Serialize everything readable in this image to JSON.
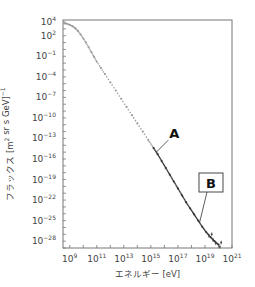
{
  "chart_data": {
    "type": "scatter",
    "title": "",
    "xlabel": "エネルギー [eV]",
    "ylabel": "フラックス [m² sr s GeV]⁻¹",
    "ylabel_parts": {
      "main": "フラックス [m",
      "sup1": "2",
      "mid": " sr s GeV]",
      "sup2": "−1"
    },
    "x_scale": "log",
    "y_scale": "log",
    "xlim_exp": [
      8.5,
      21
    ],
    "ylim_exp": [
      -29,
      4.3
    ],
    "x_ticks": [
      {
        "base": "10",
        "exp": "9",
        "value_exp": 9
      },
      {
        "base": "10",
        "exp": "11",
        "value_exp": 11
      },
      {
        "base": "10",
        "exp": "13",
        "value_exp": 13
      },
      {
        "base": "10",
        "exp": "15",
        "value_exp": 15
      },
      {
        "base": "10",
        "exp": "17",
        "value_exp": 17
      },
      {
        "base": "10",
        "exp": "19",
        "value_exp": 19
      },
      {
        "base": "10",
        "exp": "21",
        "value_exp": 21
      }
    ],
    "y_ticks": [
      {
        "base": "10",
        "exp": "4",
        "value_exp": 4
      },
      {
        "base": "10",
        "exp": "2",
        "value_exp": 2
      },
      {
        "base": "10",
        "exp": "−1",
        "value_exp": -1
      },
      {
        "base": "10",
        "exp": "−4",
        "value_exp": -4
      },
      {
        "base": "10",
        "exp": "−7",
        "value_exp": -7
      },
      {
        "base": "10",
        "exp": "−10",
        "value_exp": -10
      },
      {
        "base": "10",
        "exp": "−13",
        "value_exp": -13
      },
      {
        "base": "10",
        "exp": "−16",
        "value_exp": -16
      },
      {
        "base": "10",
        "exp": "−19",
        "value_exp": -19
      },
      {
        "base": "10",
        "exp": "−22",
        "value_exp": -22
      },
      {
        "base": "10",
        "exp": "−25",
        "value_exp": -25
      },
      {
        "base": "10",
        "exp": "−28",
        "value_exp": -28
      }
    ],
    "series": [
      {
        "name": "cosmic-ray flux",
        "points_log10": [
          [
            8.6,
            3.8
          ],
          [
            8.8,
            3.75
          ],
          [
            9.0,
            3.6
          ],
          [
            9.2,
            3.4
          ],
          [
            9.4,
            3.1
          ],
          [
            9.6,
            2.7
          ],
          [
            9.8,
            2.2
          ],
          [
            10.0,
            1.6
          ],
          [
            10.2,
            1.0
          ],
          [
            10.4,
            0.3
          ],
          [
            10.6,
            -0.4
          ],
          [
            10.8,
            -1.1
          ],
          [
            11.0,
            -1.8
          ],
          [
            11.3,
            -2.7
          ],
          [
            11.6,
            -3.6
          ],
          [
            12.0,
            -4.8
          ],
          [
            12.4,
            -6.0
          ],
          [
            12.8,
            -7.2
          ],
          [
            13.2,
            -8.4
          ],
          [
            13.6,
            -9.6
          ],
          [
            14.0,
            -10.8
          ],
          [
            14.4,
            -12.0
          ],
          [
            14.8,
            -13.2
          ],
          [
            15.2,
            -14.4
          ],
          [
            15.5,
            -15.3
          ],
          [
            15.8,
            -16.3
          ],
          [
            16.1,
            -17.3
          ],
          [
            16.4,
            -18.3
          ],
          [
            16.7,
            -19.3
          ],
          [
            17.0,
            -20.3
          ],
          [
            17.3,
            -21.3
          ],
          [
            17.6,
            -22.3
          ],
          [
            17.9,
            -23.2
          ],
          [
            18.2,
            -24.1
          ],
          [
            18.5,
            -25.0
          ],
          [
            18.8,
            -25.9
          ],
          [
            19.1,
            -26.7
          ],
          [
            19.4,
            -27.4
          ],
          [
            19.7,
            -28.0
          ],
          [
            20.0,
            -28.5
          ]
        ]
      }
    ],
    "annotations": [
      {
        "label": "A",
        "boxed": false,
        "points_to_log10": [
          15.4,
          -15.0
        ]
      },
      {
        "label": "B",
        "boxed": true,
        "points_to_log10": [
          18.6,
          -25.3
        ]
      }
    ],
    "grid": false,
    "legend": "none"
  }
}
